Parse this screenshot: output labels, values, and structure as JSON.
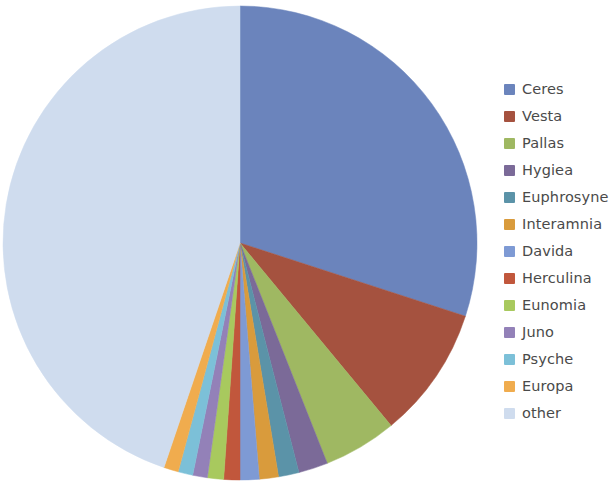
{
  "chart_data": {
    "type": "pie",
    "title": "",
    "subtitle": "",
    "xlabel": "",
    "ylabel": "",
    "legend_position": "right",
    "grid": false,
    "start_angle_deg": 0,
    "direction": "clockwise",
    "categories": [
      "Ceres",
      "Vesta",
      "Pallas",
      "Hygiea",
      "Euphrosyne",
      "Interamnia",
      "Davida",
      "Herculina",
      "Eunomia",
      "Juno",
      "Psyche",
      "Europa",
      "other"
    ],
    "values": [
      30.0,
      9.0,
      5.0,
      2.0,
      1.4,
      1.3,
      1.3,
      1.1,
      1.1,
      1.0,
      1.0,
      1.0,
      44.8
    ],
    "units": "percent",
    "colors": [
      "#6b84bc",
      "#a5523f",
      "#9fb862",
      "#7b6a98",
      "#5b93a8",
      "#d99b3c",
      "#7e9ad4",
      "#c1573c",
      "#a8c95e",
      "#9381b8",
      "#7cc0d8",
      "#f0ac4e",
      "#cfdcee"
    ],
    "slices": [
      {
        "label": "Ceres",
        "value": 30.0,
        "color": "#6b84bc"
      },
      {
        "label": "Vesta",
        "value": 9.0,
        "color": "#a5523f"
      },
      {
        "label": "Pallas",
        "value": 5.0,
        "color": "#9fb862"
      },
      {
        "label": "Hygiea",
        "value": 2.0,
        "color": "#7b6a98"
      },
      {
        "label": "Euphrosyne",
        "value": 1.4,
        "color": "#5b93a8"
      },
      {
        "label": "Interamnia",
        "value": 1.3,
        "color": "#d99b3c"
      },
      {
        "label": "Davida",
        "value": 1.3,
        "color": "#7e9ad4"
      },
      {
        "label": "Herculina",
        "value": 1.1,
        "color": "#c1573c"
      },
      {
        "label": "Eunomia",
        "value": 1.1,
        "color": "#a8c95e"
      },
      {
        "label": "Juno",
        "value": 1.0,
        "color": "#9381b8"
      },
      {
        "label": "Psyche",
        "value": 1.0,
        "color": "#7cc0d8"
      },
      {
        "label": "Europa",
        "value": 1.0,
        "color": "#f0ac4e"
      },
      {
        "label": "other",
        "value": 44.8,
        "color": "#cfdcee"
      }
    ]
  },
  "legend": {
    "items": [
      {
        "label": "Ceres",
        "color": "#6b84bc"
      },
      {
        "label": "Vesta",
        "color": "#a5523f"
      },
      {
        "label": "Pallas",
        "color": "#9fb862"
      },
      {
        "label": "Hygiea",
        "color": "#7b6a98"
      },
      {
        "label": "Euphrosyne",
        "color": "#5b93a8"
      },
      {
        "label": "Interamnia",
        "color": "#d99b3c"
      },
      {
        "label": "Davida",
        "color": "#7e9ad4"
      },
      {
        "label": "Herculina",
        "color": "#c1573c"
      },
      {
        "label": "Eunomia",
        "color": "#a8c95e"
      },
      {
        "label": "Juno",
        "color": "#9381b8"
      },
      {
        "label": "Psyche",
        "color": "#7cc0d8"
      },
      {
        "label": "Europa",
        "color": "#f0ac4e"
      },
      {
        "label": "other",
        "color": "#cfdcee"
      }
    ]
  },
  "geometry": {
    "center_x": 240,
    "center_y": 243,
    "radius": 237
  }
}
